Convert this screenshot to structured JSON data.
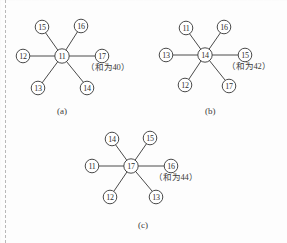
{
  "page": {
    "background_color": "#fdfdfd",
    "ink_color": "#4a4a4a",
    "margin_rule_color": "#b9b9b9"
  },
  "figures": [
    {
      "id": "figure-a",
      "caption": "(a)",
      "center_value": "11",
      "sum_note": "（和为40）",
      "arms": [
        {
          "value": "15",
          "position": "upper-left"
        },
        {
          "value": "16",
          "position": "upper-right"
        },
        {
          "value": "12",
          "position": "left"
        },
        {
          "value": "17",
          "position": "right"
        },
        {
          "value": "13",
          "position": "lower-left"
        },
        {
          "value": "14",
          "position": "lower-right"
        }
      ]
    },
    {
      "id": "figure-b",
      "caption": "(b)",
      "center_value": "14",
      "sum_note": "（和为42）",
      "arms": [
        {
          "value": "11",
          "position": "upper-left"
        },
        {
          "value": "16",
          "position": "upper-right"
        },
        {
          "value": "13",
          "position": "left"
        },
        {
          "value": "15",
          "position": "right"
        },
        {
          "value": "12",
          "position": "lower-left"
        },
        {
          "value": "17",
          "position": "lower-right"
        }
      ]
    },
    {
      "id": "figure-c",
      "caption": "(c)",
      "center_value": "17",
      "sum_note": "（和为44）",
      "arms": [
        {
          "value": "14",
          "position": "upper-left"
        },
        {
          "value": "15",
          "position": "upper-right"
        },
        {
          "value": "11",
          "position": "left"
        },
        {
          "value": "16",
          "position": "right"
        },
        {
          "value": "12",
          "position": "lower-left"
        },
        {
          "value": "13",
          "position": "lower-right"
        }
      ]
    }
  ]
}
